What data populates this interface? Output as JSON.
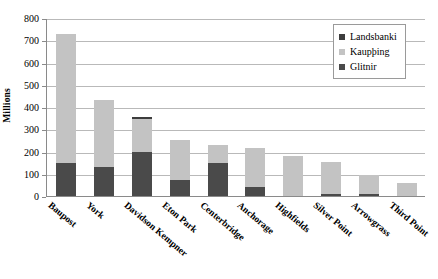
{
  "chart_data": {
    "type": "bar",
    "stacked": true,
    "title": "",
    "xlabel": "",
    "ylabel": "Millions",
    "ylim": [
      0,
      800
    ],
    "ytick_step": 100,
    "yticks": [
      800,
      700,
      600,
      500,
      400,
      300,
      200,
      100,
      0
    ],
    "grid": true,
    "legend_position": "top-right",
    "categories": [
      "Baupost",
      "York",
      "Davidson Kempner",
      "Eton Park",
      "Centerbridge",
      "Anchorage",
      "Highfields",
      "Silver Point",
      "Arrowgrass",
      "Third Point"
    ],
    "series": [
      {
        "name": "Glitnir",
        "color": "#4a4a4a",
        "values": [
          150,
          130,
          200,
          70,
          150,
          40,
          0,
          8,
          10,
          0
        ]
      },
      {
        "name": "Kaupþing",
        "color": "#c3c3c3",
        "values": [
          580,
          300,
          145,
          180,
          80,
          175,
          180,
          147,
          85,
          60
        ]
      },
      {
        "name": "Landsbanki",
        "color": "#3d3d3d",
        "values": [
          0,
          0,
          12,
          0,
          0,
          0,
          0,
          0,
          0,
          0
        ]
      }
    ],
    "totals": [
      730,
      430,
      357,
      250,
      230,
      215,
      180,
      155,
      95,
      60
    ]
  },
  "legend": {
    "items": [
      {
        "label": "Landsbanki",
        "color": "#3d3d3d"
      },
      {
        "label": "Kaupþing",
        "color": "#c3c3c3"
      },
      {
        "label": "Glitnir",
        "color": "#4a4a4a"
      }
    ]
  },
  "axes": {
    "y_title": "Millions"
  }
}
